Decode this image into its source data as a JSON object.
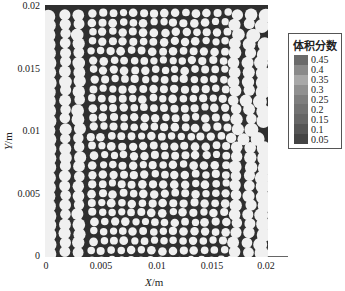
{
  "chart_data": {
    "type": "heatmap",
    "title": "",
    "xlabel": "X/m",
    "ylabel": "Y/m",
    "xlim": [
      0,
      0.02
    ],
    "ylim": [
      0,
      0.02
    ],
    "x_ticks": [
      "0",
      "0.005",
      "0.01",
      "0.015",
      "0.02"
    ],
    "y_ticks": [
      "0",
      "0.005",
      "0.01",
      "0.015",
      "0.02"
    ],
    "colorbar": {
      "title": "体积分数",
      "levels": [
        "0.45",
        "0.4",
        "0.35",
        "0.3",
        "0.25",
        "0.2",
        "0.15",
        "0.1",
        "0.05"
      ],
      "colors": [
        "#6a6a6a",
        "#8a8a8a",
        "#a8a8a8",
        "#909090",
        "#7e7e7e",
        "#727272",
        "#666666",
        "#555555",
        "#444444"
      ],
      "position": "right"
    }
  },
  "labels": {
    "x_prefix": "X",
    "x_unit": "/m",
    "y_prefix": "Y",
    "y_unit": "/m",
    "legend_title": "体积分数"
  }
}
